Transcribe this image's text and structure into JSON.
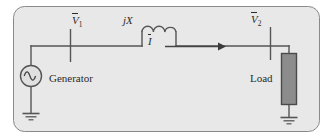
{
  "figure": {
    "name": "ac-transmission-line-circuit",
    "background_color": "#ffffff",
    "panel": {
      "fill_color": "#e8e8e8",
      "border_color": "#8a8a8a",
      "corner_radius": 11
    },
    "wire_color": "#555555",
    "load_fill_color": "#8c8c8c",
    "load_border_color": "#4a4a4a"
  },
  "labels": {
    "v1": {
      "symbol": "V",
      "subscript": "1",
      "overline": true
    },
    "v2": {
      "symbol": "V",
      "subscript": "2",
      "overline": true
    },
    "current": {
      "symbol": "I",
      "subscript": "",
      "overline": true
    },
    "reactance": "jX",
    "generator": "Generator",
    "load": "Load"
  },
  "components": {
    "source": {
      "type": "ac-source",
      "label": "Generator"
    },
    "inductor": {
      "type": "inductor",
      "label": "jX",
      "coils": 3
    },
    "load": {
      "type": "load-block",
      "label": "Load"
    },
    "ground_left": {
      "type": "ground"
    },
    "ground_right": {
      "type": "ground"
    },
    "current_arrow": {
      "type": "arrow",
      "direction": "right",
      "label": "I"
    },
    "node_v1": {
      "type": "voltage-node-marker"
    },
    "node_v2": {
      "type": "voltage-node-marker"
    }
  }
}
